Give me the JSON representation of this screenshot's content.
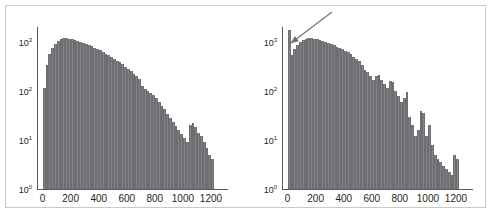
{
  "figure": {
    "panel_count": 2,
    "frame_color": "#c9c9c9",
    "bar_color": "#808285",
    "axis_color": "#58595b",
    "background": "#ffffff"
  },
  "chart_data": [
    {
      "type": "bar",
      "panel": "left",
      "title": "",
      "subtitle": "",
      "xlabel": "",
      "ylabel": "",
      "xticklabels": [
        "0",
        "200",
        "400",
        "600",
        "800",
        "1000",
        "1200"
      ],
      "xtickvalues": [
        0,
        200,
        400,
        600,
        800,
        1000,
        1200
      ],
      "yticklabels": [
        "10^0",
        "10^1",
        "10^2",
        "10^3"
      ],
      "ytickvalues": [
        1,
        10,
        100,
        1000
      ],
      "ytick_mantissa": [
        "10",
        "10",
        "10",
        "10"
      ],
      "ytick_exponent": [
        "0",
        "1",
        "2",
        "3"
      ],
      "yscale": "log",
      "xlim": [
        -40,
        1300
      ],
      "ylim": [
        1,
        2000
      ],
      "grid": false,
      "legend": null,
      "annotations": [],
      "bin_width": 20,
      "x": [
        0,
        20,
        40,
        60,
        80,
        100,
        120,
        140,
        160,
        180,
        200,
        220,
        240,
        260,
        280,
        300,
        320,
        340,
        360,
        380,
        400,
        420,
        440,
        460,
        480,
        500,
        520,
        540,
        560,
        580,
        600,
        620,
        640,
        660,
        680,
        700,
        720,
        740,
        760,
        780,
        800,
        820,
        840,
        860,
        880,
        900,
        920,
        940,
        960,
        980,
        1000,
        1020,
        1040,
        1060,
        1080,
        1100,
        1120,
        1140,
        1160,
        1180,
        1200
      ],
      "values": [
        115,
        330,
        560,
        760,
        900,
        1050,
        1130,
        1180,
        1175,
        1160,
        1130,
        1090,
        1050,
        1000,
        960,
        910,
        860,
        810,
        760,
        710,
        665,
        620,
        575,
        530,
        490,
        450,
        415,
        380,
        345,
        310,
        280,
        250,
        225,
        200,
        178,
        125,
        110,
        98,
        90,
        82,
        72,
        60,
        50,
        42,
        34,
        28,
        23,
        19,
        16,
        13,
        11,
        9,
        20,
        22,
        18,
        14,
        12,
        9,
        7,
        5,
        4,
        3.2,
        2.6,
        4.4,
        4.0,
        2.4,
        0,
        1.9,
        0,
        0,
        0,
        0,
        0,
        1.9,
        0,
        0,
        0,
        0,
        0,
        0,
        0
      ]
    },
    {
      "type": "bar",
      "panel": "right",
      "title": "",
      "subtitle": "",
      "xlabel": "",
      "ylabel": "",
      "xticklabels": [
        "0",
        "200",
        "400",
        "600",
        "800",
        "1000",
        "1200"
      ],
      "xtickvalues": [
        0,
        200,
        400,
        600,
        800,
        1000,
        1200
      ],
      "yticklabels": [
        "10^0",
        "10^1",
        "10^2",
        "10^3"
      ],
      "ytickvalues": [
        1,
        10,
        100,
        1000
      ],
      "ytick_mantissa": [
        "10",
        "10",
        "10",
        "10"
      ],
      "ytick_exponent": [
        "0",
        "1",
        "2",
        "3"
      ],
      "yscale": "log",
      "xlim": [
        -40,
        1300
      ],
      "ylim": [
        1,
        2000
      ],
      "grid": false,
      "legend": null,
      "annotations": [
        {
          "name": "spike-callout-arrow",
          "kind": "arrow",
          "label": "",
          "tail_x": 1050,
          "tail_y": 1,
          "head_x": 30,
          "head_y": 1,
          "color": "#6d6e71"
        }
      ],
      "bin_width": 20,
      "x": [
        0,
        20,
        40,
        60,
        80,
        100,
        120,
        140,
        160,
        180,
        200,
        220,
        240,
        260,
        280,
        300,
        320,
        340,
        360,
        380,
        400,
        420,
        440,
        460,
        480,
        500,
        520,
        540,
        560,
        580,
        600,
        620,
        640,
        660,
        680,
        700,
        720,
        740,
        760,
        780,
        800,
        820,
        840,
        860,
        880,
        900,
        920,
        940,
        960,
        980,
        1000,
        1020,
        1040,
        1060,
        1080,
        1100,
        1120,
        1140,
        1160,
        1180,
        1200
      ],
      "values": [
        1700,
        540,
        700,
        860,
        980,
        1080,
        1150,
        1190,
        1180,
        1160,
        1120,
        1080,
        1040,
        1000,
        950,
        900,
        850,
        800,
        750,
        700,
        650,
        610,
        560,
        500,
        450,
        400,
        330,
        270,
        240,
        200,
        165,
        200,
        210,
        170,
        140,
        115,
        160,
        150,
        100,
        80,
        60,
        70,
        95,
        30,
        20,
        12,
        16,
        38,
        35,
        12,
        20,
        8,
        5,
        4,
        3.5,
        3.0,
        2.6,
        2.2,
        1.9,
        5.0,
        4.0,
        2.8,
        2.2,
        1.9,
        1.9,
        3.0,
        1,
        1,
        1,
        1.9,
        1,
        1,
        1,
        1,
        1,
        1,
        1,
        1,
        1,
        1,
        1
      ]
    }
  ]
}
